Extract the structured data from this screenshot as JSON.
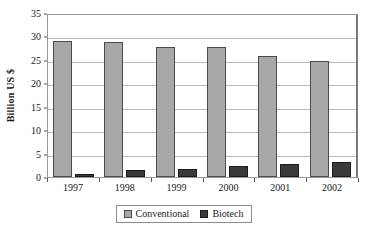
{
  "chart_data": {
    "type": "bar",
    "title": "",
    "subtitle": "",
    "xlabel": "",
    "ylabel": "Billion US $",
    "categories": [
      "1997",
      "1998",
      "1999",
      "2000",
      "2001",
      "2002"
    ],
    "series": [
      {
        "name": "Conventional",
        "color": "#a8a8a8",
        "values": [
          29.0,
          28.9,
          27.8,
          27.8,
          25.8,
          24.8
        ]
      },
      {
        "name": "Biotech",
        "color": "#3a3a3a",
        "values": [
          0.7,
          1.4,
          1.8,
          2.3,
          2.7,
          3.2
        ]
      }
    ],
    "ylim": [
      0,
      35
    ],
    "ytick_labels": [
      "0",
      "5",
      "10",
      "15",
      "20",
      "25",
      "30",
      "35"
    ],
    "ytick_values": [
      0,
      5,
      10,
      15,
      20,
      25,
      30,
      35
    ],
    "grid": true,
    "legend_position": "bottom",
    "legend_entries": [
      "Conventional",
      "Biotech"
    ]
  }
}
